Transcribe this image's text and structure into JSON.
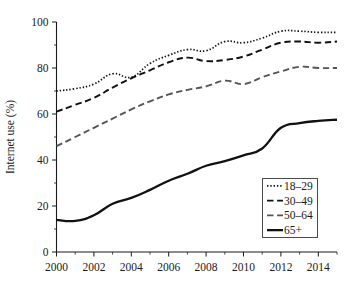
{
  "chart_data": {
    "type": "line",
    "title": "",
    "xlabel": "",
    "ylabel": "Internet use (%)",
    "xlim": [
      2000,
      2015
    ],
    "ylim": [
      0,
      100
    ],
    "grid": false,
    "legend_position": "bottom-right",
    "x": [
      2000,
      2001,
      2002,
      2003,
      2004,
      2005,
      2006,
      2007,
      2008,
      2009,
      2010,
      2011,
      2012,
      2013,
      2014,
      2015
    ],
    "xticks": [
      2000,
      2002,
      2004,
      2006,
      2008,
      2010,
      2012,
      2014
    ],
    "xtick_labels": [
      "2000",
      "2002",
      "2004",
      "2006",
      "2008",
      "2010",
      "2012",
      "2014"
    ],
    "xminor_ticks": [
      2001,
      2003,
      2005,
      2007,
      2009,
      2011,
      2013,
      2015
    ],
    "yticks": [
      0,
      20,
      40,
      60,
      80,
      100
    ],
    "ytick_labels": [
      "0",
      "20",
      "40",
      "60",
      "80",
      "100"
    ],
    "yminor_ticks": [
      10,
      30,
      50,
      70,
      90
    ],
    "series": [
      {
        "name": "18–29",
        "style": "dotted",
        "color": "#111111",
        "values": [
          70,
          71,
          73,
          77.5,
          76,
          82,
          85.5,
          88,
          87.5,
          91.5,
          91,
          93,
          96,
          96,
          95.5,
          95.5
        ]
      },
      {
        "name": "30–49",
        "style": "dashed",
        "color": "#111111",
        "values": [
          61,
          64,
          67,
          71.5,
          75.5,
          79,
          82.5,
          84.5,
          83,
          83.5,
          85,
          88,
          91,
          91.5,
          91,
          91.5
        ]
      },
      {
        "name": "50–64",
        "style": "dashed",
        "color": "#555555",
        "values": [
          46,
          50,
          54,
          58,
          62,
          65.5,
          68.5,
          70.5,
          72,
          74.5,
          73,
          76,
          78.5,
          80.5,
          80,
          80
        ]
      },
      {
        "name": "65+",
        "style": "solid",
        "color": "#111111",
        "values": [
          14,
          13.5,
          16,
          21,
          23.5,
          27,
          31,
          34,
          37.5,
          39.5,
          42,
          45,
          54,
          56,
          57,
          57.5
        ]
      }
    ]
  },
  "legend": {
    "entries": [
      {
        "label": "18–29"
      },
      {
        "label": "30–49"
      },
      {
        "label": "50–64"
      },
      {
        "label": "65+"
      }
    ]
  }
}
